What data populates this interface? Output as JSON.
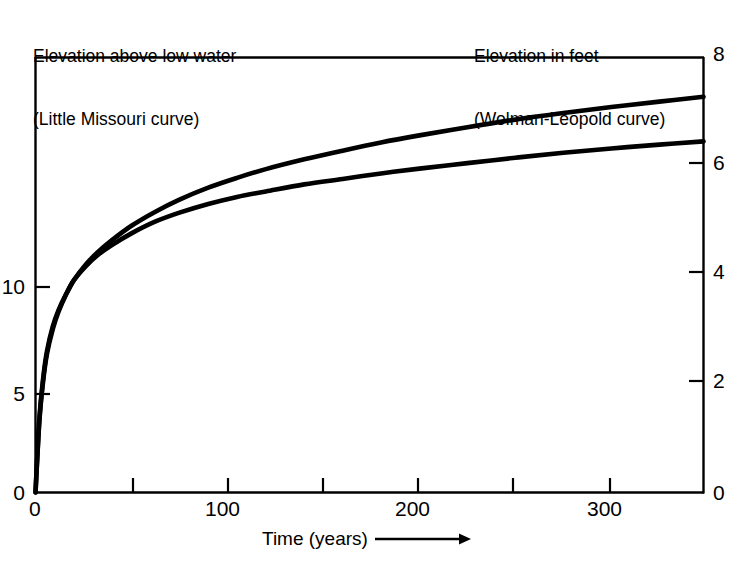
{
  "captions": {
    "left_line1": "Elevation above low water",
    "left_line2": "(Little Missouri curve)",
    "right_line1": "Elevation in feet",
    "right_line2": "(Wolman-Leopold curve)"
  },
  "xaxis": {
    "label": "Time (years)",
    "arrow_icon": "right-arrow-icon"
  },
  "ticklabels": {
    "left": [
      "0",
      "5",
      "10"
    ],
    "right": [
      "0",
      "2",
      "4",
      "6",
      "8"
    ],
    "bottom": [
      "0",
      "100",
      "200",
      "300"
    ]
  },
  "chart_data": {
    "type": "line",
    "title": "",
    "subtitle": "",
    "xlabel": "Time (years)",
    "ylabel": "Elevation above low water (Little Missouri curve)",
    "y2label": "Elevation in feet (Wolman-Leopold curve)",
    "grid": false,
    "legend": "none",
    "xlim": [
      0,
      348
    ],
    "ylim": [
      0,
      20.4
    ],
    "y2lim": [
      0,
      8
    ],
    "xticks": [
      0,
      50,
      100,
      150,
      200,
      250,
      300
    ],
    "xticklabels": [
      "0",
      "",
      "100",
      "",
      "200",
      "",
      "300"
    ],
    "yticks": [
      0,
      5,
      10
    ],
    "yticklabels": [
      "0",
      "5",
      "10"
    ],
    "y2ticks": [
      0,
      2,
      4,
      6,
      8
    ],
    "y2ticklabels": [
      "0",
      "2",
      "4",
      "6",
      "8"
    ],
    "series": [
      {
        "name": "Little Missouri curve",
        "axis": "right",
        "color": "#000000",
        "x": [
          0,
          2,
          4,
          6,
          9,
          12,
          16,
          20,
          26,
          32,
          40,
          50,
          62,
          75,
          90,
          105,
          120,
          140,
          160,
          180,
          200,
          225,
          250,
          275,
          300,
          325,
          348
        ],
        "y": [
          0.0,
          1.35,
          2.1,
          2.6,
          3.05,
          3.35,
          3.65,
          3.9,
          4.15,
          4.35,
          4.55,
          4.76,
          4.97,
          5.14,
          5.3,
          5.43,
          5.53,
          5.66,
          5.76,
          5.86,
          5.95,
          6.05,
          6.15,
          6.24,
          6.32,
          6.39,
          6.45
        ]
      },
      {
        "name": "Wolman-Leopold curve",
        "axis": "right",
        "color": "#000000",
        "x": [
          0,
          2,
          4,
          6,
          9,
          12,
          16,
          20,
          26,
          32,
          40,
          50,
          62,
          75,
          90,
          105,
          120,
          140,
          160,
          180,
          200,
          225,
          250,
          275,
          300,
          325,
          348
        ],
        "y": [
          0.0,
          1.3,
          2.05,
          2.55,
          3.0,
          3.32,
          3.64,
          3.9,
          4.18,
          4.4,
          4.64,
          4.9,
          5.15,
          5.38,
          5.6,
          5.78,
          5.94,
          6.12,
          6.28,
          6.43,
          6.56,
          6.71,
          6.85,
          6.97,
          7.08,
          7.18,
          7.27
        ]
      }
    ],
    "annotations": []
  },
  "style": {
    "axis_color": "#000000",
    "curve_color": "#000000",
    "background": "#ffffff"
  }
}
